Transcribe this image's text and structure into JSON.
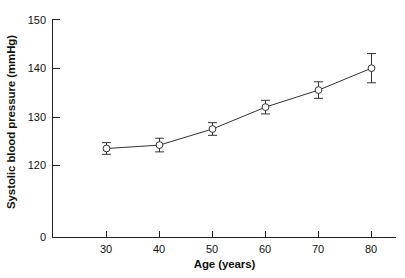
{
  "chart_data": {
    "type": "line",
    "title": "",
    "subtitle": "",
    "xlabel": "Age (years)",
    "ylabel": "Systolic blood pressure (mmHg)",
    "x": [
      30,
      40,
      50,
      60,
      70,
      80
    ],
    "values": [
      123.5,
      124.2,
      127.5,
      132.0,
      135.5,
      140.0
    ],
    "errors": [
      1.2,
      1.4,
      1.3,
      1.4,
      1.7,
      3.0
    ],
    "xtick_labels": [
      "30",
      "40",
      "50",
      "60",
      "70",
      "80"
    ],
    "ytick_labels": [
      "0",
      "120",
      "130",
      "140",
      "150"
    ],
    "ytick_values": [
      0,
      120,
      130,
      140,
      150
    ],
    "xlim": [
      25,
      85
    ],
    "ylim": [
      120,
      150
    ],
    "axis_break": true,
    "grid": false,
    "legend": null,
    "marker": "open-circle",
    "line_color": "#333333",
    "marker_color": "#333333",
    "background": "#ffffff",
    "series": [
      {
        "name": "Systolic blood pressure",
        "values": [
          123.5,
          124.2,
          127.5,
          132.0,
          135.5,
          140.0
        ],
        "errors": [
          1.2,
          1.4,
          1.3,
          1.4,
          1.7,
          3.0
        ]
      }
    ]
  },
  "axis": {
    "y_label_text": "Systolic blood pressure (mmHg)",
    "x_label_text": "Age (years)",
    "y_ticks": [
      {
        "label": "150"
      },
      {
        "label": "140"
      },
      {
        "label": "130"
      },
      {
        "label": "120"
      },
      {
        "label": "0"
      }
    ],
    "x_ticks": [
      {
        "label": "30"
      },
      {
        "label": "40"
      },
      {
        "label": "50"
      },
      {
        "label": "60"
      },
      {
        "label": "70"
      },
      {
        "label": "80"
      }
    ]
  }
}
